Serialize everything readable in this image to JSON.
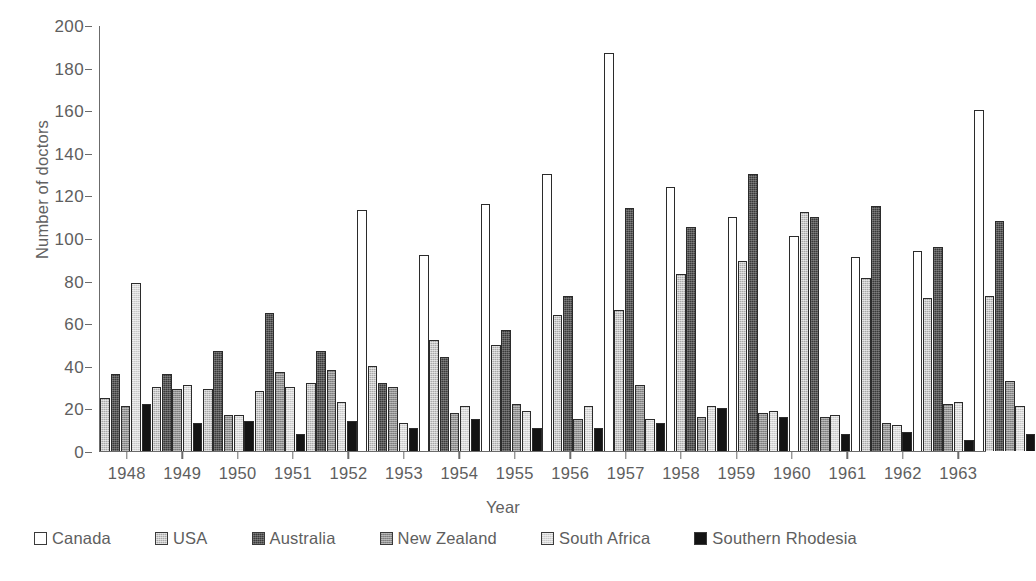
{
  "chart_data": {
    "type": "bar",
    "title": "",
    "xlabel": "Year",
    "ylabel": "Number of doctors",
    "ylim": [
      0,
      200
    ],
    "ytick_step": 20,
    "yticks": [
      0,
      20,
      40,
      60,
      80,
      100,
      120,
      140,
      160,
      180,
      200
    ],
    "grid": false,
    "legend_position": "bottom",
    "categories": [
      "1948",
      "1949",
      "1950",
      "1951",
      "1952",
      "1953",
      "1954",
      "1955",
      "1956",
      "1957",
      "1958",
      "1959",
      "1960",
      "1961",
      "1962",
      "1963"
    ],
    "series": [
      {
        "name": "Canada",
        "color": "#ffffff",
        "swatch": "s-canada",
        "values": [
          null,
          null,
          null,
          null,
          null,
          113,
          92,
          116,
          130,
          187,
          124,
          110,
          101,
          91,
          94,
          160
        ]
      },
      {
        "name": "USA",
        "color": "#a9a9a9",
        "swatch": "s-usa",
        "values": [
          25,
          30,
          29,
          28,
          32,
          40,
          52,
          50,
          64,
          66,
          83,
          89,
          112,
          81,
          72,
          73
        ]
      },
      {
        "name": "Australia",
        "color": "#3a3a3a",
        "swatch": "s-australia",
        "values": [
          36,
          36,
          47,
          65,
          47,
          32,
          44,
          57,
          73,
          114,
          105,
          130,
          110,
          115,
          96,
          108
        ]
      },
      {
        "name": "New Zealand",
        "color": "#8f8f8f",
        "swatch": "s-newzealand",
        "values": [
          21,
          29,
          17,
          37,
          38,
          30,
          18,
          22,
          15,
          31,
          16,
          18,
          16,
          13,
          22,
          33
        ]
      },
      {
        "name": "South Africa",
        "color": "#d8d8d8",
        "swatch": "s-southafrica",
        "values": [
          79,
          31,
          17,
          30,
          23,
          13,
          21,
          19,
          21,
          15,
          21,
          19,
          17,
          12,
          23,
          21
        ]
      },
      {
        "name": "Southern Rhodesia",
        "color": "#141414",
        "swatch": "s-southernrhodesia",
        "values": [
          22,
          13,
          14,
          8,
          14,
          11,
          15,
          11,
          11,
          13,
          20,
          16,
          8,
          9,
          5,
          8
        ]
      }
    ]
  }
}
